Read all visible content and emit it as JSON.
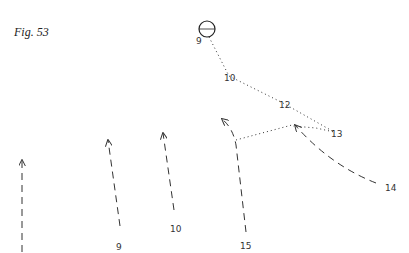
{
  "figure": {
    "title": "Fig. 53"
  },
  "colors": {
    "ink": "#333333",
    "background": "#ffffff"
  },
  "ball": {
    "label": "9",
    "cx": 207,
    "cy": 29,
    "r": 8
  },
  "pass_path": {
    "style": "dotted",
    "points": [
      [
        207,
        37
      ],
      [
        229,
        78
      ],
      [
        283,
        105
      ],
      [
        336,
        133
      ],
      [
        293,
        127
      ]
    ],
    "labels": [
      {
        "text": "10",
        "x": 224,
        "y": 81
      },
      {
        "text": "12",
        "x": 279,
        "y": 108
      },
      {
        "text": "13",
        "x": 332,
        "y": 137
      }
    ]
  },
  "players": [
    {
      "id": "left",
      "label": "",
      "style": "dashed",
      "from": [
        22,
        252
      ],
      "to": [
        22,
        160
      ]
    },
    {
      "id": "9",
      "label": "9",
      "label_pos": [
        117,
        250
      ],
      "style": "dashed",
      "from": [
        120,
        228
      ],
      "to": [
        108,
        140
      ]
    },
    {
      "id": "10",
      "label": "10",
      "label_pos": [
        171,
        232
      ],
      "style": "dashed",
      "from": [
        174,
        212
      ],
      "to": [
        163,
        133
      ]
    },
    {
      "id": "15",
      "label": "15",
      "label_pos": [
        241,
        249
      ],
      "style": "dashed",
      "from": [
        246,
        232
      ],
      "via": [
        236,
        140
      ],
      "to": [
        222,
        119
      ]
    },
    {
      "id": "14",
      "label": "14",
      "label_pos": [
        385,
        191
      ],
      "style": "dashed",
      "from": [
        378,
        186
      ],
      "to": [
        294,
        124
      ]
    }
  ],
  "extra_pass": {
    "style": "dotted",
    "from": [
      236,
      140
    ],
    "to": [
      293,
      125
    ]
  },
  "labels": {
    "ball": "9",
    "p10": "10",
    "p12": "12",
    "p13": "13",
    "p14": "14",
    "p15": "15",
    "p9": "9",
    "p10b": "10"
  }
}
